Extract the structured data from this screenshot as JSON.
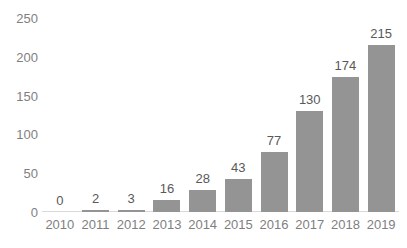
{
  "chart_data": {
    "type": "bar",
    "title": "",
    "subtitle": "",
    "xlabel": "",
    "ylabel": "",
    "categories": [
      "2010",
      "2011",
      "2012",
      "2013",
      "2014",
      "2015",
      "2016",
      "2017",
      "2018",
      "2019"
    ],
    "values": [
      0,
      2,
      3,
      16,
      28,
      43,
      77,
      130,
      174,
      215
    ],
    "data_labels": [
      "0",
      "2",
      "3",
      "16",
      "28",
      "43",
      "77",
      "130",
      "174",
      "215"
    ],
    "ylim": [
      0,
      250
    ],
    "ytick_values": [
      250,
      200,
      150,
      100,
      50,
      0
    ],
    "ytick_labels": [
      "250",
      "200",
      "150",
      "100",
      "50",
      "0"
    ],
    "ytick_step": 50,
    "grid": false,
    "legend": false,
    "legend_position": "none",
    "colors": {
      "bar": "#949494",
      "axis_line": "#d9d9d9",
      "tick_label": "#7f7f7f",
      "data_label": "#595959",
      "background": "#ffffff"
    }
  }
}
